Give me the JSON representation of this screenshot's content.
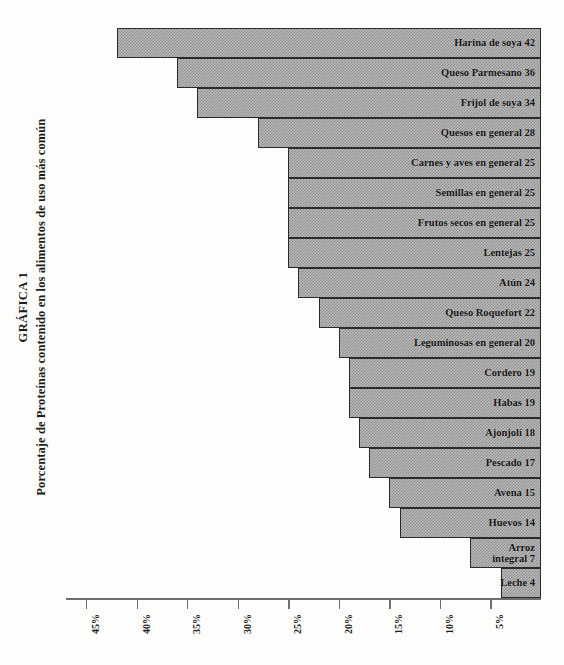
{
  "title": {
    "line1": "GRÁFICA 1",
    "line2": "Porcentaje de Proteínas contenido en los alimentos de uso más común"
  },
  "axis": {
    "ticks": [
      "45%",
      "40%",
      "35%",
      "30%",
      "25%",
      "20%",
      "15%",
      "10%",
      "5%"
    ],
    "tick_values": [
      45,
      40,
      35,
      30,
      25,
      20,
      15,
      10,
      5
    ],
    "reversed": true
  },
  "chart_data": {
    "type": "bar",
    "orientation": "horizontal",
    "xlabel": "",
    "ylabel": "",
    "xlim": [
      0,
      47
    ],
    "x_axis_reversed": true,
    "grid": false,
    "legend": "none",
    "unit": "%",
    "categories": [
      "Harina de soya",
      "Queso Parmesano",
      "Frijol de soya",
      "Quesos en general",
      "Carnes y aves en general",
      "Semillas en general",
      "Frutos secos en general",
      "Lentejas",
      "Atún",
      "Queso Roquefort",
      "Leguminosas en general",
      "Cordero",
      "Habas",
      "Ajonjolí",
      "Pescado",
      "Avena",
      "Huevos",
      "Arroz integral",
      "Leche"
    ],
    "values": [
      42,
      36,
      34,
      28,
      25,
      25,
      25,
      25,
      24,
      22,
      20,
      19,
      19,
      18,
      17,
      15,
      14,
      7,
      4
    ],
    "labels": [
      "Harina de soya 42",
      "Queso Parmesano 36",
      "Frijol de soya 34",
      "Quesos en general 28",
      "Carnes y aves en general 25",
      "Semillas en general 25",
      "Frutos secos en general 25",
      "Lentejas 25",
      "Atún 24",
      "Queso Roquefort 22",
      "Leguminosas en general 20",
      "Cordero 19",
      "Habas 19",
      "Ajonjolí 18",
      "Pescado 17",
      "Avena 15",
      "Huevos 14",
      "Arroz integral 7",
      "Leche 4"
    ],
    "colors": {
      "bar_fill": "#b9b9b9",
      "bar_pattern": "#8c8c8c",
      "bar_border": "#2a2a2a",
      "text": "#131313",
      "axis": "#6e6e6e",
      "background": "#fdfdfc"
    }
  }
}
